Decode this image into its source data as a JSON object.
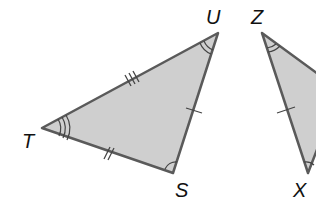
{
  "diagram": {
    "type": "congruent-triangles",
    "colors": {
      "fill": "#cfcfcf",
      "stroke": "#5a5a5a",
      "label": "#111111",
      "background": "#ffffff"
    },
    "triangles": [
      {
        "name": "TUS",
        "vertices": [
          {
            "label": "T",
            "x": 42,
            "y": 128
          },
          {
            "label": "U",
            "x": 218,
            "y": 33
          },
          {
            "label": "S",
            "x": 173,
            "y": 173
          }
        ],
        "markings": {
          "TU": "triple tick",
          "US": "single tick",
          "TS": "double tick",
          "angle_T": "triple arc",
          "angle_U": "double arc",
          "angle_S": "single arc"
        }
      },
      {
        "name": "ZXY (partial)",
        "vertices": [
          {
            "label": "Z",
            "x": 262,
            "y": 33
          },
          {
            "label": "X",
            "x": 308,
            "y": 173
          }
        ],
        "markings": {
          "ZX": "single tick",
          "angle_Z": "double arc",
          "angle_X": "single arc"
        }
      }
    ],
    "labels": {
      "T": "T",
      "U": "U",
      "S": "S",
      "Z": "Z",
      "X": "X"
    }
  }
}
